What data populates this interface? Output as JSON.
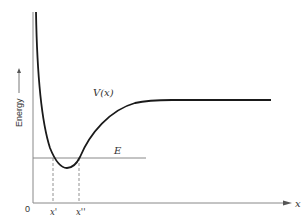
{
  "diagram": {
    "y_axis_label": "Energy",
    "x_axis_label": "x",
    "origin_label": "0",
    "curve_label": "V(x)",
    "energy_level_label": "E",
    "turning_points": [
      "x'",
      "x''"
    ],
    "colors": {
      "curve": "#1a1a1a",
      "axes": "#777777",
      "energy_line": "#888888",
      "dashed": "#777777",
      "text": "#333333"
    }
  }
}
